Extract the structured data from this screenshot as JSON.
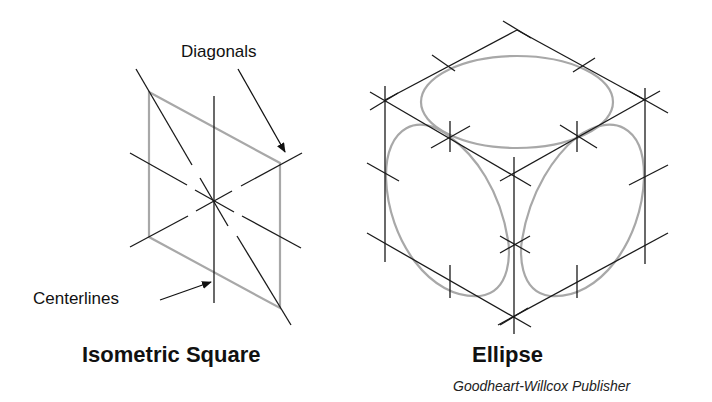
{
  "figures": {
    "left": {
      "title": "Isometric Square",
      "callouts": {
        "diagonals": "Diagonals",
        "centerlines": "Centerlines"
      }
    },
    "right": {
      "title": "Ellipse"
    }
  },
  "credit": "Goodheart-Willcox Publisher",
  "colors": {
    "construction_line": "#1a1a1a",
    "shape_outline": "#a8a8a8",
    "background": "#ffffff"
  }
}
